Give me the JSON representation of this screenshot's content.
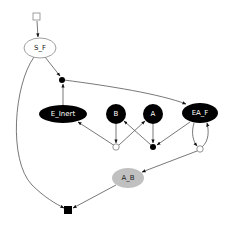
{
  "diagram": {
    "type": "graph",
    "nodes": [
      {
        "id": "start",
        "shape": "square",
        "label": "",
        "fill": "#ffffff"
      },
      {
        "id": "S_F",
        "shape": "ellipse",
        "label": "S_F",
        "fill": "#ffffff"
      },
      {
        "id": "join1",
        "shape": "dot",
        "label": "",
        "fill": "#000000"
      },
      {
        "id": "E_Inert",
        "shape": "ellipse",
        "label": "E_Inert",
        "fill": "#000000"
      },
      {
        "id": "B",
        "shape": "circle",
        "label": "B",
        "fill": "#000000"
      },
      {
        "id": "A",
        "shape": "circle",
        "label": "A",
        "fill": "#000000"
      },
      {
        "id": "EA_F",
        "shape": "ellipse",
        "label": "EA_F",
        "fill": "#000000"
      },
      {
        "id": "split1",
        "shape": "open-dot",
        "label": "",
        "fill": "#ffffff"
      },
      {
        "id": "join2",
        "shape": "dot",
        "label": "",
        "fill": "#000000"
      },
      {
        "id": "split2",
        "shape": "open-dot",
        "label": "",
        "fill": "#ffffff"
      },
      {
        "id": "A_B",
        "shape": "ellipse",
        "label": "A_B",
        "fill": "#c0c0c0"
      },
      {
        "id": "end",
        "shape": "square",
        "label": "",
        "fill": "#000000"
      }
    ],
    "edges": [
      {
        "from": "start",
        "to": "S_F"
      },
      {
        "from": "S_F",
        "to": "join1"
      },
      {
        "from": "E_Inert",
        "to": "join1"
      },
      {
        "from": "join1",
        "to": "EA_F"
      },
      {
        "from": "split1",
        "to": "E_Inert"
      },
      {
        "from": "B",
        "to": "split1"
      },
      {
        "from": "split1",
        "to": "A"
      },
      {
        "from": "join2",
        "to": "B"
      },
      {
        "from": "A",
        "to": "join2"
      },
      {
        "from": "EA_F",
        "to": "join2"
      },
      {
        "from": "EA_F",
        "to": "split2"
      },
      {
        "from": "split2",
        "to": "EA_F"
      },
      {
        "from": "split2",
        "to": "A_B"
      },
      {
        "from": "S_F",
        "to": "end"
      },
      {
        "from": "A_B",
        "to": "end"
      }
    ],
    "colors": {
      "edge": "#555555",
      "node_dark": "#000000",
      "node_gray": "#c0c0c0",
      "node_light": "#ffffff",
      "border_light": "#888888"
    }
  }
}
